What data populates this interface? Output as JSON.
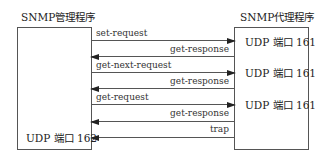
{
  "manager": {
    "title": "SNMP管理程序",
    "port_label": "UDP 端口 162"
  },
  "agent": {
    "title": "SNMP代理程序",
    "port_labels": [
      "UDP 端口 161",
      "UDP 端口 161",
      "UDP 端口 161"
    ]
  },
  "messages": [
    {
      "label": "set-request",
      "direction": "to-agent"
    },
    {
      "label": "get-response",
      "direction": "to-manager"
    },
    {
      "label": "get-next-request",
      "direction": "to-agent"
    },
    {
      "label": "get-response",
      "direction": "to-manager"
    },
    {
      "label": "get-request",
      "direction": "to-agent"
    },
    {
      "label": "get-response",
      "direction": "to-manager"
    },
    {
      "label": "trap",
      "direction": "to-manager"
    }
  ],
  "colors": {
    "line": "#555555",
    "arrowhead": "#222222",
    "text": "#333333"
  }
}
